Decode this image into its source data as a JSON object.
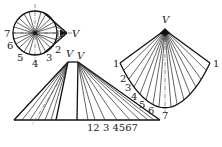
{
  "diagram": {
    "colors": {
      "line": "#111111",
      "background": "#ffffff"
    },
    "plan_view": {
      "apex_label": "V",
      "point_labels": [
        "1",
        "2",
        "3",
        "4",
        "5",
        "6",
        "7"
      ]
    },
    "front_view": {
      "apex_labels": [
        "V",
        "V"
      ],
      "baseline_labels": [
        "1",
        "2",
        "3",
        "4",
        "5",
        "6",
        "7"
      ],
      "baseline_label_text": "12 3 4567"
    },
    "development": {
      "apex_label": "V",
      "left_end_label": "1",
      "right_end_label": "1",
      "curve_labels": [
        "2",
        "3",
        "4",
        "5",
        "6",
        "7"
      ]
    }
  }
}
